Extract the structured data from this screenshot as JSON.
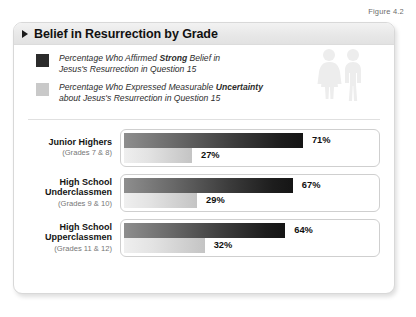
{
  "figure_caption": "Figure 4.2",
  "title": "Belief in Resurrection by Grade",
  "icons": {
    "title_marker": "triangle-right-icon",
    "people": "two-people-icon"
  },
  "legend": {
    "items": [
      {
        "swatch_color": "#2b2b2b",
        "swatch_name": "dark",
        "line1_prefix": "Percentage Who Affirmed ",
        "line1_bold": "Strong",
        "line1_suffix": " Belief in",
        "line2": "Jesus's Resurrection in Question 15"
      },
      {
        "swatch_color": "#c9c9c9",
        "swatch_name": "light",
        "line1_prefix": "Percentage Who Expressed Measurable ",
        "line1_bold": "Uncertainty",
        "line1_suffix": "",
        "line2": "about Jesus's Resurrection in Question 15"
      }
    ]
  },
  "chart_data": {
    "type": "bar",
    "orientation": "horizontal",
    "title": "Belief in Resurrection by Grade",
    "xlabel": "",
    "ylabel": "",
    "xlim": [
      0,
      100
    ],
    "grid": false,
    "legend_position": "top",
    "categories": [
      "Junior Highers",
      "High School Underclassmen",
      "High School Upperclassmen"
    ],
    "category_sublabels": [
      "(Grades 7 & 8)",
      "(Grades 9 & 10)",
      "(Grades 11 & 12)"
    ],
    "series": [
      {
        "name": "Percentage Who Affirmed Strong Belief in Jesus's Resurrection in Question 15",
        "color": "#2b2b2b",
        "values": [
          71,
          67,
          64
        ],
        "value_labels": [
          "71%",
          "67%",
          "64%"
        ]
      },
      {
        "name": "Percentage Who Expressed Measurable Uncertainty about Jesus's Resurrection in Question 15",
        "color": "#c9c9c9",
        "values": [
          27,
          29,
          32
        ],
        "value_labels": [
          "27%",
          "29%",
          "32%"
        ]
      }
    ]
  },
  "groups": [
    {
      "name": "Junior Highers",
      "sub": "(Grades 7 & 8)",
      "dark_value": 71,
      "dark_label": "71%",
      "light_value": 27,
      "light_label": "27%"
    },
    {
      "name": "High School Underclassmen",
      "sub": "(Grades 9 & 10)",
      "dark_value": 67,
      "dark_label": "67%",
      "light_value": 29,
      "light_label": "29%"
    },
    {
      "name": "High School Upperclassmen",
      "sub": "(Grades 11 & 12)",
      "dark_value": 64,
      "dark_label": "64%",
      "light_value": 32,
      "light_label": "32%"
    }
  ]
}
